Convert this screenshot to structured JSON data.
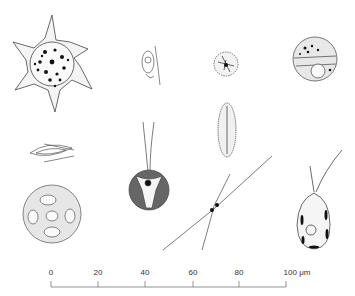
{
  "figure": {
    "organisms": [
      {
        "name": "star-shaped-colony",
        "position": "top-left"
      },
      {
        "name": "small-flagellate",
        "position": "top-center-left"
      },
      {
        "name": "spiny-round-cell",
        "position": "top-center-right"
      },
      {
        "name": "divided-round-cell",
        "position": "top-right"
      },
      {
        "name": "elongate-diatom",
        "position": "middle-center-right"
      },
      {
        "name": "spindle-cell",
        "position": "middle-left"
      },
      {
        "name": "flagellated-round-cell",
        "position": "middle-center"
      },
      {
        "name": "crossing-filament-cell",
        "position": "bottom-center-right"
      },
      {
        "name": "pear-shaped-flagellate",
        "position": "bottom-right"
      },
      {
        "name": "colony-sphere",
        "position": "bottom-left"
      }
    ],
    "scale_bar": {
      "ticks": [
        "0",
        "20",
        "40",
        "60",
        "80",
        "100 μm"
      ],
      "unit": "μm",
      "max": 100
    }
  }
}
